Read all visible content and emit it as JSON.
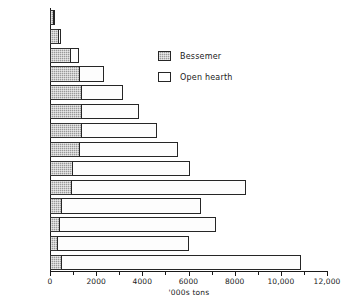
{
  "chart_data": {
    "type": "bar",
    "orientation": "horizontal",
    "stacked": true,
    "title": "",
    "xlabel": "'000s tons",
    "ylabel": "",
    "xlim": [
      0,
      12000
    ],
    "grid": false,
    "legend_position": "upper-right-inside",
    "xticks": [
      0,
      2000,
      4000,
      6000,
      8000,
      10000,
      12000
    ],
    "xtick_labels": [
      "0",
      "2000",
      "4000",
      "6000",
      "8000",
      "10,000",
      "12,000"
    ],
    "categories": [
      "1871-4",
      "75-9",
      "80-4",
      "85-9",
      "90-4",
      "95-9",
      "1900-4",
      "05-9",
      "10-14",
      "15-19",
      "20-4",
      "25-9",
      "30-4",
      "35-9"
    ],
    "series": [
      {
        "name": "Bessemer",
        "color": "#9a9a9a",
        "values": [
          180,
          400,
          900,
          1300,
          1400,
          1400,
          1400,
          1300,
          1000,
          950,
          500,
          450,
          350,
          500
        ]
      },
      {
        "name": "Open hearth",
        "color": "#ffffff",
        "values": [
          40,
          120,
          400,
          1100,
          1800,
          2500,
          3300,
          4300,
          5100,
          7600,
          6100,
          6800,
          5700,
          10400
        ]
      }
    ],
    "totals": [
      220,
      520,
      1300,
      2400,
      3200,
      3900,
      4700,
      5600,
      6100,
      8550,
      6600,
      7250,
      6050,
      10900
    ]
  },
  "legend": {
    "items": [
      {
        "label": "Bessemer",
        "swatch": "hatched-gray"
      },
      {
        "label": "Open hearth",
        "swatch": "white-outline"
      }
    ]
  }
}
